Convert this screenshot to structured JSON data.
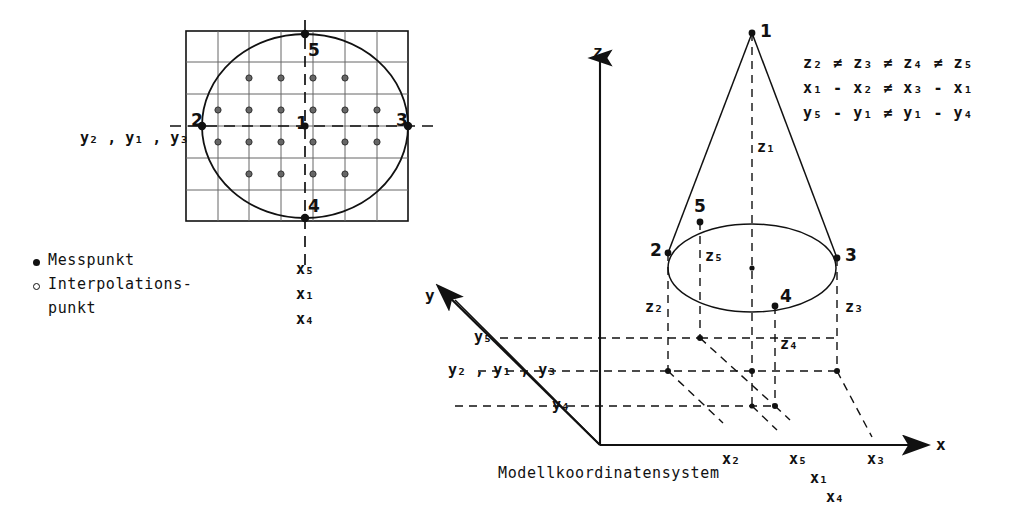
{
  "figure": {
    "caption": "Modellkoordinatensystem",
    "legend": [
      {
        "marker": "filled-dot",
        "label": "Messpunkt"
      },
      {
        "marker": "open-dot",
        "label": "Interpolations-"
      },
      {
        "marker": "none",
        "label": "punkt"
      }
    ],
    "equations": [
      {
        "id": "eq-z",
        "parts": [
          "z",
          "2",
          "≠",
          "z",
          "3",
          "≠",
          "z",
          "4",
          "≠",
          "z",
          "5"
        ],
        "text": "z₂ ≠ z₃ ≠ z₄ ≠ z₅"
      },
      {
        "id": "eq-x",
        "text": "x₁ - x₂ ≠ x₃ - x₁"
      },
      {
        "id": "eq-y",
        "text": "y₅ - y₁ ≠ y₁ - y₄"
      }
    ]
  },
  "left_panel": {
    "name": "plan-view-grid",
    "y_axis_label": {
      "text": "y₂ , y₁ , y₃",
      "base": "y",
      "subs": [
        "2",
        "1",
        "3"
      ]
    },
    "point_labels": [
      "1",
      "2",
      "3",
      "4",
      "5"
    ],
    "x_labels": [
      {
        "base": "x",
        "sub": "5",
        "text": "x₅"
      },
      {
        "base": "x",
        "sub": "1",
        "text": "x₁"
      },
      {
        "base": "x",
        "sub": "4",
        "text": "x₄"
      }
    ],
    "grid": {
      "cols": 7,
      "rows": 6
    }
  },
  "right_panel": {
    "name": "model-coordinate-system-3d",
    "axes": [
      {
        "name": "z-axis",
        "label": "z"
      },
      {
        "name": "y-axis",
        "label": "y"
      },
      {
        "name": "x-axis",
        "label": "x"
      }
    ],
    "cone_apex_label": "1",
    "base_point_labels": [
      "2",
      "3",
      "4",
      "5"
    ],
    "height_labels": [
      {
        "text": "z₁",
        "base": "z",
        "sub": "1"
      },
      {
        "text": "z₅",
        "base": "z",
        "sub": "5"
      },
      {
        "text": "z₂",
        "base": "z",
        "sub": "2"
      },
      {
        "text": "z₃",
        "base": "z",
        "sub": "3"
      },
      {
        "text": "z₄",
        "base": "z",
        "sub": "4"
      }
    ],
    "y_tick_labels": [
      {
        "text": "y₅",
        "base": "y",
        "sub": "5"
      },
      {
        "text": "y₂ , y₁ , y₃",
        "base": "y",
        "subs": [
          "2",
          "1",
          "3"
        ]
      },
      {
        "text": "y₄",
        "base": "y",
        "sub": "4"
      }
    ],
    "x_tick_labels": [
      {
        "text": "x₂",
        "base": "x",
        "sub": "2"
      },
      {
        "text": "x₅",
        "base": "x",
        "sub": "5"
      },
      {
        "text": "x₁",
        "base": "x",
        "sub": "1"
      },
      {
        "text": "x₄",
        "base": "x",
        "sub": "4"
      },
      {
        "text": "x₃",
        "base": "x",
        "sub": "3"
      }
    ]
  },
  "colors": {
    "ink": "#111111",
    "grid": "#555555",
    "paper": "#ffffff"
  }
}
